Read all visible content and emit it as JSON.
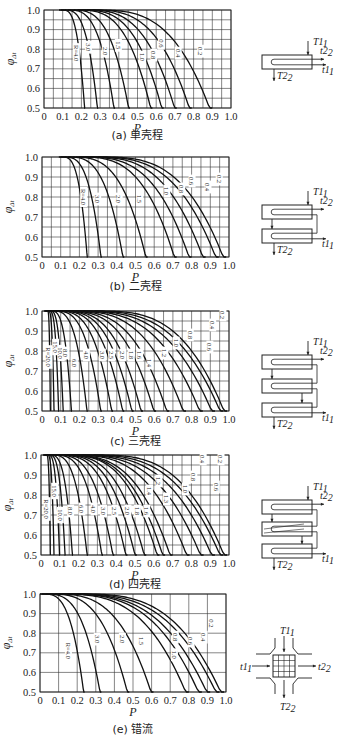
{
  "chart_data": [
    {
      "id": "a",
      "type": "line",
      "title": "(a) 单壳程",
      "caption": "(a) 单壳程",
      "xlabel": "P",
      "ylabel": "φΔt",
      "xlim": [
        0,
        1.0
      ],
      "ylim": [
        0.5,
        1.0
      ],
      "xticks": [
        "0",
        "0.1",
        "0.2",
        "0.3",
        "0.4",
        "0.5",
        "0.6",
        "0.7",
        "0.8",
        "0.9",
        "1.0"
      ],
      "yticks": [
        "0.5",
        "0.6",
        "0.7",
        "0.8",
        "0.9",
        "1.0"
      ],
      "grid": true,
      "grid_x_step": 0.05,
      "grid_y_step": 0.05,
      "series": [
        {
          "name": "R=4.0",
          "label": "R=4.0",
          "p_start": 0.1,
          "p_end": 0.22,
          "label_pos": [
            0.17,
            0.78
          ]
        },
        {
          "name": "R=3.0",
          "label": "3.0",
          "p_start": 0.11,
          "p_end": 0.29,
          "label_pos": [
            0.235,
            0.81
          ]
        },
        {
          "name": "R=2.0",
          "label": "2.0",
          "p_start": 0.13,
          "p_end": 0.38,
          "label_pos": [
            0.325,
            0.79
          ]
        },
        {
          "name": "R=1.5",
          "label": "1.5",
          "p_start": 0.15,
          "p_end": 0.46,
          "label_pos": [
            0.395,
            0.82
          ]
        },
        {
          "name": "R=1.0",
          "label": "1.0",
          "p_start": 0.18,
          "p_end": 0.58,
          "label_pos": [
            0.525,
            0.76
          ]
        },
        {
          "name": "R=0.8",
          "label": "0.8",
          "p_start": 0.2,
          "p_end": 0.64,
          "label_pos": [
            0.585,
            0.77
          ]
        },
        {
          "name": "R=0.6",
          "label": "0.6",
          "p_start": 0.22,
          "p_end": 0.71,
          "label_pos": [
            0.625,
            0.83
          ]
        },
        {
          "name": "R=0.4",
          "label": "0.4",
          "p_start": 0.25,
          "p_end": 0.79,
          "label_pos": [
            0.715,
            0.78
          ]
        },
        {
          "name": "R=0.2",
          "label": "0.2",
          "p_start": 0.28,
          "p_end": 0.9,
          "label_pos": [
            0.835,
            0.79
          ]
        }
      ],
      "diagram": {
        "type": "single-shell",
        "labels": [
          "T1",
          "t2",
          "t1",
          "T2"
        ]
      }
    },
    {
      "id": "b",
      "type": "line",
      "title": "(b) 二壳程",
      "caption": "(b) 二壳程",
      "xlabel": "P",
      "ylabel": "φΔt",
      "xlim": [
        0,
        1.0
      ],
      "ylim": [
        0.5,
        1.0
      ],
      "xticks": [
        "0",
        "0.1",
        "0.2",
        "0.3",
        "0.4",
        "0.5",
        "0.6",
        "0.7",
        "0.8",
        "0.9",
        "1.0"
      ],
      "yticks": [
        "0.5",
        "0.6",
        "0.7",
        "0.8",
        "0.9",
        "1.0"
      ],
      "grid": true,
      "grid_x_step": 0.05,
      "grid_y_step": 0.05,
      "series": [
        {
          "name": "R=4.0",
          "label": "R=4.0",
          "p_start": 0.11,
          "p_end": 0.245,
          "label_pos": [
            0.22,
            0.8
          ]
        },
        {
          "name": "R=3.0",
          "label": "3.0",
          "p_start": 0.12,
          "p_end": 0.32,
          "label_pos": [
            0.295,
            0.79
          ]
        },
        {
          "name": "R=2.0",
          "label": "2.0",
          "p_start": 0.14,
          "p_end": 0.44,
          "label_pos": [
            0.41,
            0.79
          ]
        },
        {
          "name": "R=1.5",
          "label": "1.5",
          "p_start": 0.16,
          "p_end": 0.565,
          "label_pos": [
            0.52,
            0.79
          ]
        },
        {
          "name": "R=1.0",
          "label": "1.0",
          "p_start": 0.2,
          "p_end": 0.72,
          "label_pos": [
            0.665,
            0.83
          ]
        },
        {
          "name": "R=0.8",
          "label": "0.8",
          "p_start": 0.22,
          "p_end": 0.8,
          "label_pos": [
            0.745,
            0.84
          ]
        },
        {
          "name": "R=0.6",
          "label": "0.6",
          "p_start": 0.25,
          "p_end": 0.875,
          "label_pos": [
            0.8,
            0.88
          ]
        },
        {
          "name": "R=0.4",
          "label": "0.4",
          "p_start": 0.28,
          "p_end": 0.945,
          "label_pos": [
            0.885,
            0.85
          ]
        },
        {
          "name": "R=0.2",
          "label": "0.2",
          "p_start": 0.32,
          "p_end": 0.985,
          "label_pos": [
            0.945,
            0.89
          ]
        }
      ],
      "diagram": {
        "type": "two-shell",
        "labels": [
          "T1",
          "t2",
          "t1",
          "T2"
        ]
      }
    },
    {
      "id": "c",
      "type": "line",
      "title": "(c) 三壳程",
      "caption": "(c) 三壳程",
      "xlabel": "P",
      "ylabel": "φΔt",
      "xlim": [
        0,
        1.0
      ],
      "ylim": [
        0.5,
        1.0
      ],
      "xticks": [
        "0",
        "0.1",
        "0.2",
        "0.3",
        "0.4",
        "0.5",
        "0.6",
        "0.7",
        "0.8",
        "0.9",
        "1.0"
      ],
      "yticks": [
        "0.5",
        "0.6",
        "0.7",
        "0.8",
        "0.9",
        "1.0"
      ],
      "grid": true,
      "grid_x_step": 0.05,
      "grid_y_step": 0.05,
      "series": [
        {
          "name": "R=20.0",
          "label": "R=20.0",
          "p_start": 0.03,
          "p_end": 0.045,
          "label_pos": [
            0.035,
            0.77
          ]
        },
        {
          "name": "R=15.0",
          "label": "15.0",
          "p_start": 0.035,
          "p_end": 0.065,
          "label_pos": [
            0.07,
            0.82
          ]
        },
        {
          "name": "R=10.0",
          "label": "10.0",
          "p_start": 0.04,
          "p_end": 0.09,
          "label_pos": [
            0.1,
            0.79
          ]
        },
        {
          "name": "R=8.0",
          "label": "8.0",
          "p_start": 0.045,
          "p_end": 0.115,
          "label_pos": [
            0.125,
            0.79
          ]
        },
        {
          "name": "R=6.0",
          "label": "6.0",
          "p_start": 0.05,
          "p_end": 0.16,
          "label_pos": [
            0.17,
            0.74
          ]
        },
        {
          "name": "R=4.0",
          "label": "4.0",
          "p_start": 0.06,
          "p_end": 0.245,
          "label_pos": [
            0.235,
            0.78
          ]
        },
        {
          "name": "R=3.0",
          "label": "3.0",
          "p_start": 0.07,
          "p_end": 0.32,
          "label_pos": [
            0.32,
            0.78
          ]
        },
        {
          "name": "R=2.5",
          "label": "2.5",
          "p_start": 0.08,
          "p_end": 0.38,
          "label_pos": [
            0.37,
            0.78
          ]
        },
        {
          "name": "R=2.0",
          "label": "2.0",
          "p_start": 0.09,
          "p_end": 0.44,
          "label_pos": [
            0.43,
            0.78
          ]
        },
        {
          "name": "R=1.8",
          "label": "1.8",
          "p_start": 0.1,
          "p_end": 0.49,
          "label_pos": [
            0.475,
            0.78
          ]
        },
        {
          "name": "R=1.6",
          "label": "1.6",
          "p_start": 0.11,
          "p_end": 0.54,
          "label_pos": [
            0.52,
            0.78
          ]
        },
        {
          "name": "R=1.4",
          "label": "1.4",
          "p_start": 0.12,
          "p_end": 0.61,
          "label_pos": [
            0.575,
            0.74
          ]
        },
        {
          "name": "R=1.2",
          "label": "1.2",
          "p_start": 0.13,
          "p_end": 0.68,
          "label_pos": [
            0.655,
            0.79
          ]
        },
        {
          "name": "R=1.0",
          "label": "1.0",
          "p_start": 0.15,
          "p_end": 0.77,
          "label_pos": [
            0.715,
            0.84
          ]
        },
        {
          "name": "R=0.8",
          "label": "0.8",
          "p_start": 0.17,
          "p_end": 0.86,
          "label_pos": [
            0.79,
            0.88
          ]
        },
        {
          "name": "R=0.6",
          "label": "0.6",
          "p_start": 0.2,
          "p_end": 0.925,
          "label_pos": [
            0.895,
            0.82
          ]
        },
        {
          "name": "R=0.4",
          "label": "0.4",
          "p_start": 0.24,
          "p_end": 0.97,
          "label_pos": [
            0.91,
            0.93
          ]
        },
        {
          "name": "R=0.2",
          "label": "0.2",
          "p_start": 0.3,
          "p_end": 0.99,
          "label_pos": [
            0.965,
            0.98
          ]
        }
      ],
      "diagram": {
        "type": "three-shell",
        "labels": [
          "T1",
          "t2",
          "t1",
          "T2"
        ]
      }
    },
    {
      "id": "d",
      "type": "line",
      "title": "(d) 四壳程",
      "caption": "(d) 四壳程",
      "xlabel": "P",
      "ylabel": "φΔt",
      "xlim": [
        0,
        1.0
      ],
      "ylim": [
        0.5,
        1.0
      ],
      "xticks": [
        "0",
        "0.1",
        "0.2",
        "0.3",
        "0.4",
        "0.5",
        "0.6",
        "0.7",
        "0.8",
        "0.9",
        "1.0"
      ],
      "yticks": [
        "0.5",
        "0.6",
        "0.7",
        "0.8",
        "0.9",
        "1.0"
      ],
      "grid": true,
      "grid_x_step": 0.05,
      "grid_y_step": 0.05,
      "series": [
        {
          "name": "R=20.0",
          "label": "R=20.0",
          "p_start": 0.03,
          "p_end": 0.05,
          "label_pos": [
            0.03,
            0.73
          ]
        },
        {
          "name": "R=15.0",
          "label": "15.0",
          "p_start": 0.035,
          "p_end": 0.07,
          "label_pos": [
            0.07,
            0.82
          ]
        },
        {
          "name": "R=10.0",
          "label": "10.0",
          "p_start": 0.04,
          "p_end": 0.1,
          "label_pos": [
            0.1,
            0.7
          ]
        },
        {
          "name": "R=8.0",
          "label": "8.0",
          "p_start": 0.045,
          "p_end": 0.13,
          "label_pos": [
            0.155,
            0.72
          ]
        },
        {
          "name": "R=6.0",
          "label": "6.0",
          "p_start": 0.05,
          "p_end": 0.17,
          "label_pos": [
            0.215,
            0.73
          ]
        },
        {
          "name": "R=4.0",
          "label": "4.0",
          "p_start": 0.06,
          "p_end": 0.25,
          "label_pos": [
            0.28,
            0.73
          ]
        },
        {
          "name": "R=3.0",
          "label": "3.0",
          "p_start": 0.07,
          "p_end": 0.33,
          "label_pos": [
            0.33,
            0.72
          ]
        },
        {
          "name": "R=2.5",
          "label": "2.5",
          "p_start": 0.08,
          "p_end": 0.39,
          "label_pos": [
            0.39,
            0.72
          ]
        },
        {
          "name": "R=2.0",
          "label": "2.0",
          "p_start": 0.09,
          "p_end": 0.46,
          "label_pos": [
            0.46,
            0.72
          ]
        },
        {
          "name": "R=1.8",
          "label": "1.8",
          "p_start": 0.1,
          "p_end": 0.51,
          "label_pos": [
            0.51,
            0.72
          ]
        },
        {
          "name": "R=1.6",
          "label": "1.6",
          "p_start": 0.11,
          "p_end": 0.56,
          "label_pos": [
            0.56,
            0.72
          ]
        },
        {
          "name": "R=1.4",
          "label": "1.4",
          "p_start": 0.12,
          "p_end": 0.63,
          "label_pos": [
            0.575,
            0.82
          ]
        },
        {
          "name": "R=1.3",
          "label": "1.3",
          "p_start": 0.125,
          "p_end": 0.66,
          "label_pos": [
            0.665,
            0.78
          ]
        },
        {
          "name": "R=1.2",
          "label": "1.2",
          "p_start": 0.13,
          "p_end": 0.7,
          "label_pos": [
            0.625,
            0.87
          ]
        },
        {
          "name": "R=1.0",
          "label": "1.0",
          "p_start": 0.15,
          "p_end": 0.79,
          "label_pos": [
            0.765,
            0.83
          ]
        },
        {
          "name": "R=0.8",
          "label": "0.8",
          "p_start": 0.17,
          "p_end": 0.865,
          "label_pos": [
            0.81,
            0.89
          ]
        },
        {
          "name": "R=0.6",
          "label": "0.6",
          "p_start": 0.2,
          "p_end": 0.925,
          "label_pos": [
            0.93,
            0.84
          ]
        },
        {
          "name": "R=0.4",
          "label": "0.4",
          "p_start": 0.24,
          "p_end": 0.97,
          "label_pos": [
            0.86,
            0.98
          ]
        },
        {
          "name": "R=0.2",
          "label": "0.2",
          "p_start": 0.3,
          "p_end": 0.99,
          "label_pos": [
            0.955,
            0.98
          ]
        }
      ],
      "diagram": {
        "type": "four-shell",
        "labels": [
          "T1",
          "t2",
          "t1",
          "T2"
        ]
      }
    },
    {
      "id": "e",
      "type": "line",
      "title": "(e) 错流",
      "caption": "(e) 错流",
      "xlabel": "P",
      "ylabel": "φΔt",
      "xlim": [
        0,
        1.0
      ],
      "ylim": [
        0.5,
        1.0
      ],
      "xticks": [
        "0",
        "0.1",
        "0.2",
        "0.3",
        "0.4",
        "0.5",
        "0.6",
        "0.7",
        "0.8",
        "0.9",
        "1.0"
      ],
      "yticks": [
        "0.5",
        "0.6",
        "0.7",
        "0.8",
        "0.9",
        "1.0"
      ],
      "grid": true,
      "grid_x_step": 0.1,
      "grid_y_step": 0.1,
      "series": [
        {
          "name": "R=4.0",
          "label": "R=4.0",
          "p_start": 0.02,
          "p_end": 0.24,
          "label_pos": [
            0.15,
            0.71
          ]
        },
        {
          "name": "R=3.0",
          "label": "3.0",
          "p_start": 0.03,
          "p_end": 0.33,
          "label_pos": [
            0.305,
            0.77
          ]
        },
        {
          "name": "R=2.0",
          "label": "2.0",
          "p_start": 0.05,
          "p_end": 0.48,
          "label_pos": [
            0.44,
            0.77
          ]
        },
        {
          "name": "R=1.5",
          "label": "1.5",
          "p_start": 0.07,
          "p_end": 0.61,
          "label_pos": [
            0.545,
            0.76
          ]
        },
        {
          "name": "R=1.0",
          "label": "1.0",
          "p_start": 0.1,
          "p_end": 0.8,
          "label_pos": [
            0.72,
            0.69
          ]
        },
        {
          "name": "R=0.8",
          "label": "0.8",
          "p_start": 0.12,
          "p_end": 0.87,
          "label_pos": [
            0.725,
            0.78
          ]
        },
        {
          "name": "R=0.6",
          "label": "0.6",
          "p_start": 0.14,
          "p_end": 0.915,
          "label_pos": [
            0.81,
            0.76
          ]
        },
        {
          "name": "R=0.4",
          "label": "0.4",
          "p_start": 0.17,
          "p_end": 0.965,
          "label_pos": [
            0.88,
            0.78
          ]
        },
        {
          "name": "R=0.2",
          "label": "0.2",
          "p_start": 0.22,
          "p_end": 0.99,
          "label_pos": [
            0.92,
            0.85
          ]
        }
      ],
      "diagram": {
        "type": "cross-flow",
        "labels": [
          "T1",
          "t1",
          "t2",
          "T2"
        ]
      }
    }
  ],
  "layout": {
    "panels": [
      {
        "id": "a",
        "frame": [
          44,
          10,
          231,
          108
        ],
        "caption_y": 139,
        "diagram_xy": [
          262,
          55
        ]
      },
      {
        "id": "b",
        "frame": [
          42,
          157,
          229,
          257
        ],
        "caption_y": 290,
        "diagram_xy": [
          262,
          205
        ]
      },
      {
        "id": "c",
        "frame": [
          42,
          311,
          229,
          411
        ],
        "caption_y": 445,
        "diagram_xy": [
          262,
          355
        ]
      },
      {
        "id": "d",
        "frame": [
          41,
          455,
          229,
          555
        ],
        "caption_y": 588,
        "diagram_xy": [
          262,
          500
        ]
      },
      {
        "id": "e",
        "frame": [
          40,
          594,
          226,
          692
        ],
        "caption_y": 733,
        "diagram_xy": [
          262,
          640
        ]
      }
    ]
  }
}
